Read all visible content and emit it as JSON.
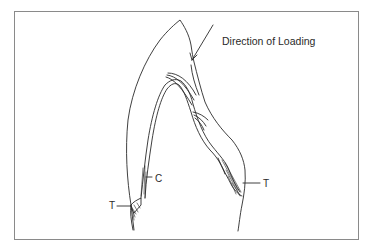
{
  "figure": {
    "type": "tooth cross-section stress diagram",
    "labels": {
      "direction": "Direction of Loading",
      "compression": "C",
      "tension_left": "T",
      "tension_right": "T"
    },
    "colors": {
      "stroke": "#2a2a2a",
      "frame": "#8a8a8a",
      "background": "#ffffff"
    }
  }
}
